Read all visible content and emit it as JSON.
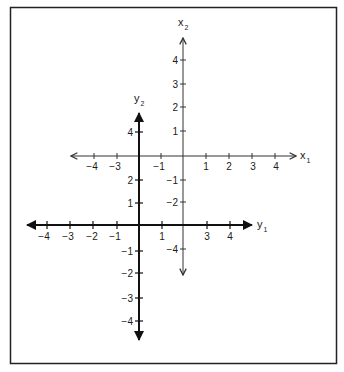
{
  "figure": {
    "colors": {
      "background": "#ffffff",
      "frame": "#222222",
      "x_system_stroke": "#333333",
      "y_system_stroke": "#111111"
    }
  },
  "x_system": {
    "horizontal_axis": {
      "name": "x",
      "subscript": "1",
      "tick_labels": [
        "−4",
        "−3",
        "−1",
        "1",
        "2",
        "3",
        "4"
      ]
    },
    "vertical_axis": {
      "name": "x",
      "subscript": "2",
      "tick_labels": [
        "4",
        "3",
        "2",
        "1",
        "−1",
        "−2",
        "−4"
      ]
    }
  },
  "y_system": {
    "horizontal_axis": {
      "name": "y",
      "subscript": "1",
      "tick_labels": [
        "−4",
        "−3",
        "−2",
        "−1",
        "1",
        "3",
        "4"
      ]
    },
    "vertical_axis": {
      "name": "y",
      "subscript": "2",
      "tick_labels": [
        "4",
        "2",
        "1",
        "−1",
        "−2",
        "−3",
        "−4"
      ]
    }
  }
}
